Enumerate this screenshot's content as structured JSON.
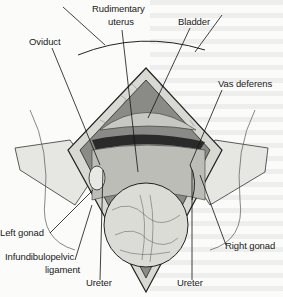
{
  "figure": {
    "type": "surgical illustration",
    "labels": {
      "rudimentary_uterus_line1": "Rudimentary",
      "rudimentary_uterus_line2": "uterus",
      "bladder": "Bladder",
      "oviduct": "Oviduct",
      "vas_deferens": "Vas deferens",
      "left_gonad": "Left gonad",
      "infundibulopelvic_line1": "Infundibulopelvic",
      "infundibulopelvic_line2": "ligament",
      "ureter_left": "Ureter",
      "ureter_right": "Ureter",
      "right_gonad": "Right gonad"
    }
  }
}
